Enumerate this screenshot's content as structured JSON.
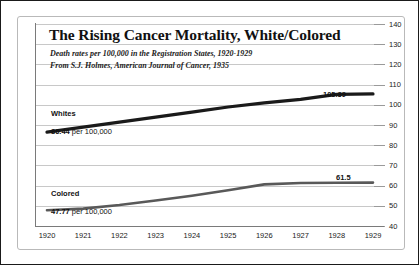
{
  "chart_data": {
    "type": "line",
    "title": "The Rising Cancer Mortality, White/Colored",
    "subtitle_1": "Death rates per 100,000 in the Registration States, 1920-1929",
    "subtitle_2": "From S.J. Holmes, American Journal of Cancer, 1935",
    "xlabel": "",
    "ylabel": "",
    "categories": [
      "1920",
      "1921",
      "1922",
      "1923",
      "1924",
      "1925",
      "1926",
      "1927",
      "1928",
      "1929"
    ],
    "x": [
      1920,
      1921,
      1922,
      1923,
      1924,
      1925,
      1926,
      1927,
      1928,
      1929
    ],
    "ylim": [
      40,
      140
    ],
    "yticks": [
      "140",
      "130",
      "120",
      "110",
      "100",
      "90",
      "80",
      "70",
      "60",
      "50",
      "40"
    ],
    "ytick_values": [
      140,
      130,
      120,
      110,
      100,
      90,
      80,
      70,
      60,
      50,
      40
    ],
    "grid": true,
    "legend_position": "inline-annotations",
    "series": [
      {
        "name": "Whites",
        "color": "#1a1a1a",
        "values": [
          86.44,
          88.9,
          91.4,
          93.9,
          96.4,
          98.9,
          101.0,
          102.7,
          105.2,
          105.39
        ],
        "start_label": "86.44 per 100,000",
        "start_label_bold": "86.44",
        "start_label_rest": " per 100,000",
        "end_label": "105.39"
      },
      {
        "name": "Colored",
        "color": "#595959",
        "values": [
          47.77,
          48.6,
          50.4,
          52.6,
          55.0,
          57.7,
          60.6,
          61.3,
          61.4,
          61.5
        ],
        "start_label": "47.77 per 100,000",
        "start_label_bold": "47.77",
        "start_label_rest": " per 100,000",
        "end_label": "61.5"
      }
    ]
  },
  "colors": {
    "whites_line": "#1a1a1a",
    "colored_line": "#595959",
    "gridline": "#c8c8c8",
    "axis": "#7a7a7a",
    "page_border": "#1a1a1a",
    "card_border": "#b9b9b9",
    "text": "#111111"
  }
}
